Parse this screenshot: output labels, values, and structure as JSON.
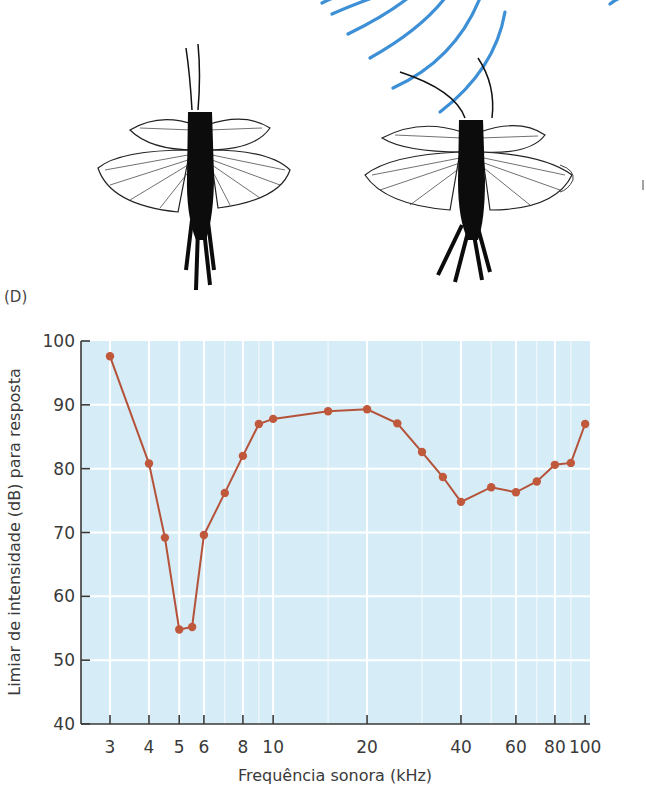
{
  "panel_label": "(D)",
  "illustration": {
    "description": "Two flying insects (crickets) viewed from above; right one with bent antenna near blue sound wave arcs",
    "wave_color": "#3d8fd6"
  },
  "colors": {
    "plot_background": "#d6ecf7",
    "grid": "#ffffff",
    "line": "#b5523a",
    "marker": "#c0583c",
    "axis": "#3a3a3a"
  },
  "chart_data": {
    "type": "line",
    "title": "",
    "xlabel": "Frequência sonora (kHz)",
    "ylabel": "Limiar de intensidade (dB) para resposta",
    "xscale": "log",
    "xlim": [
      2.7,
      100
    ],
    "ylim": [
      40,
      100
    ],
    "x_ticks": [
      3,
      4,
      5,
      6,
      8,
      10,
      20,
      40,
      60,
      80,
      100
    ],
    "x_tick_labels": [
      "3",
      "4",
      "5",
      "6",
      "8",
      "10",
      "20",
      "40",
      "60",
      "80",
      "100"
    ],
    "y_ticks": [
      40,
      50,
      60,
      70,
      80,
      90,
      100
    ],
    "y_tick_labels": [
      "40",
      "50",
      "60",
      "70",
      "80",
      "90",
      "100"
    ],
    "grid": true,
    "legend": null,
    "series": [
      {
        "name": "Limiar",
        "x": [
          3,
          4,
          4.5,
          5,
          5.5,
          6,
          7,
          8,
          9,
          10,
          15,
          20,
          25,
          30,
          35,
          40,
          50,
          60,
          70,
          80,
          90,
          100
        ],
        "y": [
          97.6,
          80.8,
          69.2,
          54.8,
          55.2,
          69.6,
          76.2,
          82.0,
          87.0,
          87.8,
          89.0,
          89.3,
          87.1,
          82.6,
          78.7,
          74.8,
          77.1,
          76.3,
          78.0,
          80.6,
          80.9,
          87.0
        ]
      }
    ]
  }
}
